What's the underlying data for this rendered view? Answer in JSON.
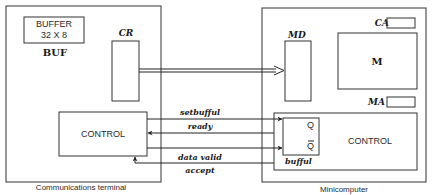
{
  "terminal": {
    "caption": "Communications terminal",
    "buffer_line1": "BUFFER",
    "buffer_line2": "32 X 8",
    "buffer_label": "BUF",
    "register_label": "CR",
    "control_label": "CONTROL"
  },
  "minicomputer": {
    "caption": "Minicomputer",
    "ca_label": "CA",
    "ma_label": "MA",
    "memory_label": "M",
    "md_label": "MD",
    "control_label": "CONTROL",
    "flipflop_q": "Q",
    "flipflop_qbar": "Q",
    "flipflop_label": "bufful"
  },
  "signals": [
    {
      "label": "setbufful",
      "direction": "to-minicomputer"
    },
    {
      "label": "ready",
      "direction": "to-terminal"
    },
    {
      "label": "data valid",
      "direction": "to-minicomputer"
    },
    {
      "label": "accept",
      "direction": "to-terminal"
    }
  ],
  "colors": {
    "stroke": "#333333",
    "background": "#ffffff"
  }
}
